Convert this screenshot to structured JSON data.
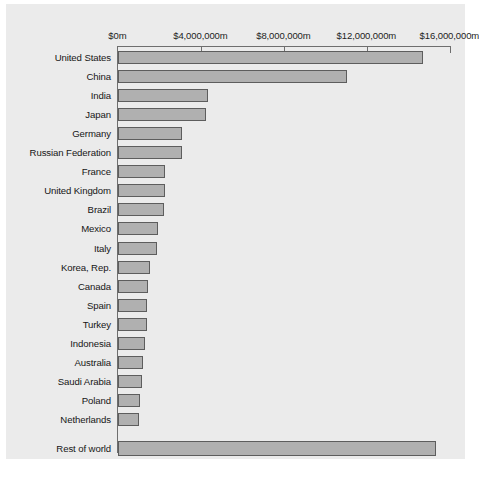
{
  "chart_data": {
    "type": "bar",
    "orientation": "horizontal",
    "title": "",
    "subtitle": "",
    "xlabel": "",
    "ylabel": "",
    "xlim": [
      0,
      16000000
    ],
    "grid": false,
    "legend": null,
    "axis": {
      "position": "top",
      "tick_labels": [
        "$0m",
        "$4,000,000m",
        "$8,000,000m",
        "$12,000,000m",
        "$16,000,000m"
      ],
      "tick_values": [
        0,
        4000000,
        8000000,
        12000000,
        16000000
      ],
      "unit_suffix": "m",
      "currency": "$"
    },
    "categories": [
      "United States",
      "China",
      "India",
      "Japan",
      "Germany",
      "Russian Federation",
      "France",
      "United Kingdom",
      "Brazil",
      "Mexico",
      "Italy",
      "Korea, Rep.",
      "Canada",
      "Spain",
      "Turkey",
      "Indonesia",
      "Australia",
      "Saudi Arabia",
      "Poland",
      "Netherlands",
      "Rest of world"
    ],
    "values": [
      14700000,
      11000000,
      4300000,
      4200000,
      3050000,
      3050000,
      2250000,
      2250000,
      2200000,
      1900000,
      1880000,
      1500000,
      1450000,
      1370000,
      1400000,
      1300000,
      1200000,
      1120000,
      1020000,
      1010000,
      15300000
    ],
    "colors": {
      "bar_fill": "#b0b0b0",
      "bar_stroke": "#5d5d5d",
      "plot_background": "#ebebeb",
      "axis_line": "#6e6e6e",
      "text": "#161616"
    }
  }
}
